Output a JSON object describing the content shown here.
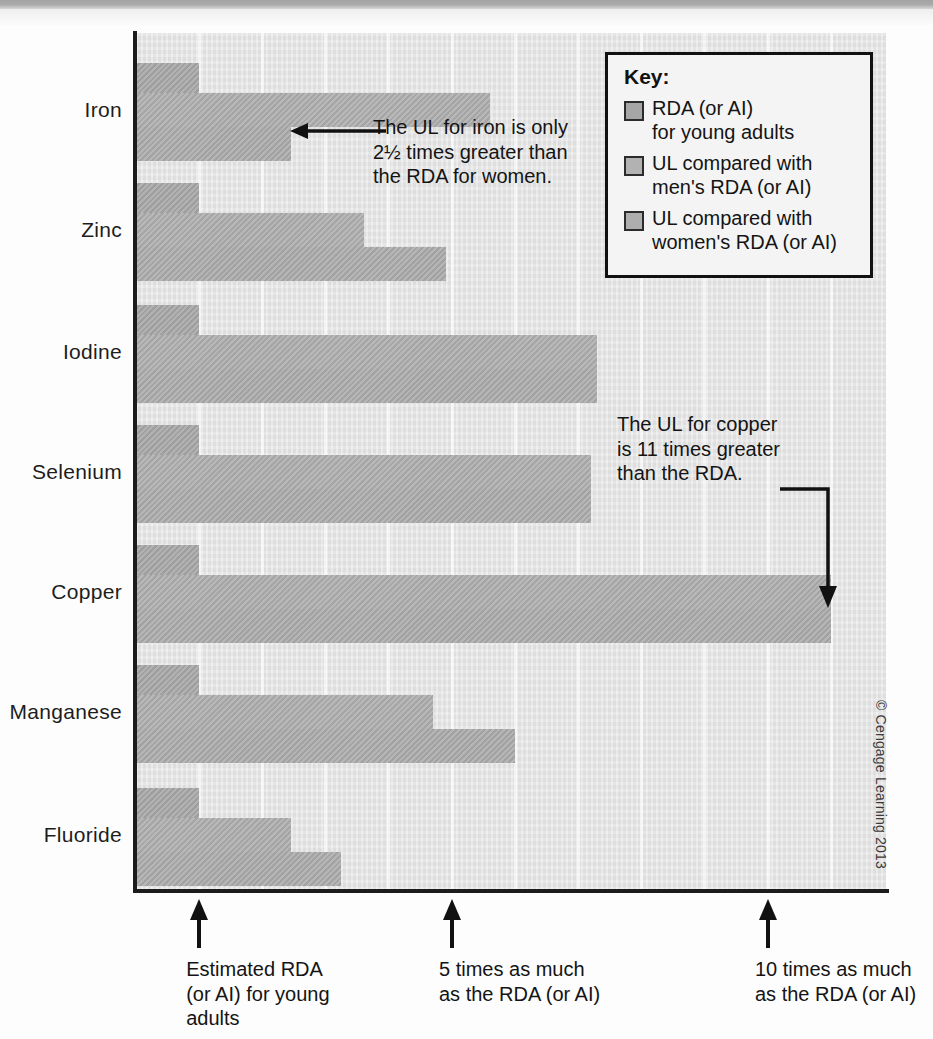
{
  "chart_data": {
    "type": "bar",
    "orientation": "horizontal",
    "title": "",
    "xlabel": "",
    "ylabel": "",
    "xlim": [
      0,
      11.9
    ],
    "grid": true,
    "unit_description": "multiples of the RDA (or AI) for young adults",
    "categories": [
      "Iron",
      "Zinc",
      "Iodine",
      "Selenium",
      "Copper",
      "Manganese",
      "Fluoride"
    ],
    "series": [
      {
        "name": "RDA (or AI) for young adults",
        "color": "#a6a6a6",
        "values": [
          1,
          1,
          1,
          1,
          1,
          1,
          1
        ]
      },
      {
        "name": "UL compared with men's RDA (or AI)",
        "color": "#aeaeae",
        "values": [
          5.6,
          3.6,
          7.3,
          7.2,
          11.0,
          4.7,
          2.45
        ]
      },
      {
        "name": "UL compared with women's RDA (or AI)",
        "color": "#ababab",
        "values": [
          2.45,
          4.9,
          7.3,
          7.2,
          11.0,
          6.0,
          3.25
        ]
      }
    ],
    "ticks": [
      {
        "value": 1,
        "label": "Estimated RDA\n(or AI) for young\nadults"
      },
      {
        "value": 5,
        "label": "5 times as much\nas the RDA (or AI)"
      },
      {
        "value": 10,
        "label": "10 times as much\nas the RDA (or AI)"
      }
    ],
    "annotations": [
      {
        "text": "The UL for iron is only\n2½ times greater than\nthe RDA for women.",
        "target": "Iron — women's UL bar"
      },
      {
        "text": "The UL for copper\nis 11 times greater\nthan the RDA.",
        "target": "Copper — UL bars"
      }
    ]
  },
  "legend": {
    "title": "Key:",
    "items": [
      {
        "label": "RDA (or AI)\nfor young adults",
        "color": "#a6a6a6"
      },
      {
        "label": "UL compared with\nmen's RDA (or AI)",
        "color": "#aeaeae"
      },
      {
        "label": "UL compared with\nwomen's RDA (or AI)",
        "color": "#ababab"
      }
    ]
  },
  "footer": {
    "copyright": "© Cengage Learning 2013"
  }
}
